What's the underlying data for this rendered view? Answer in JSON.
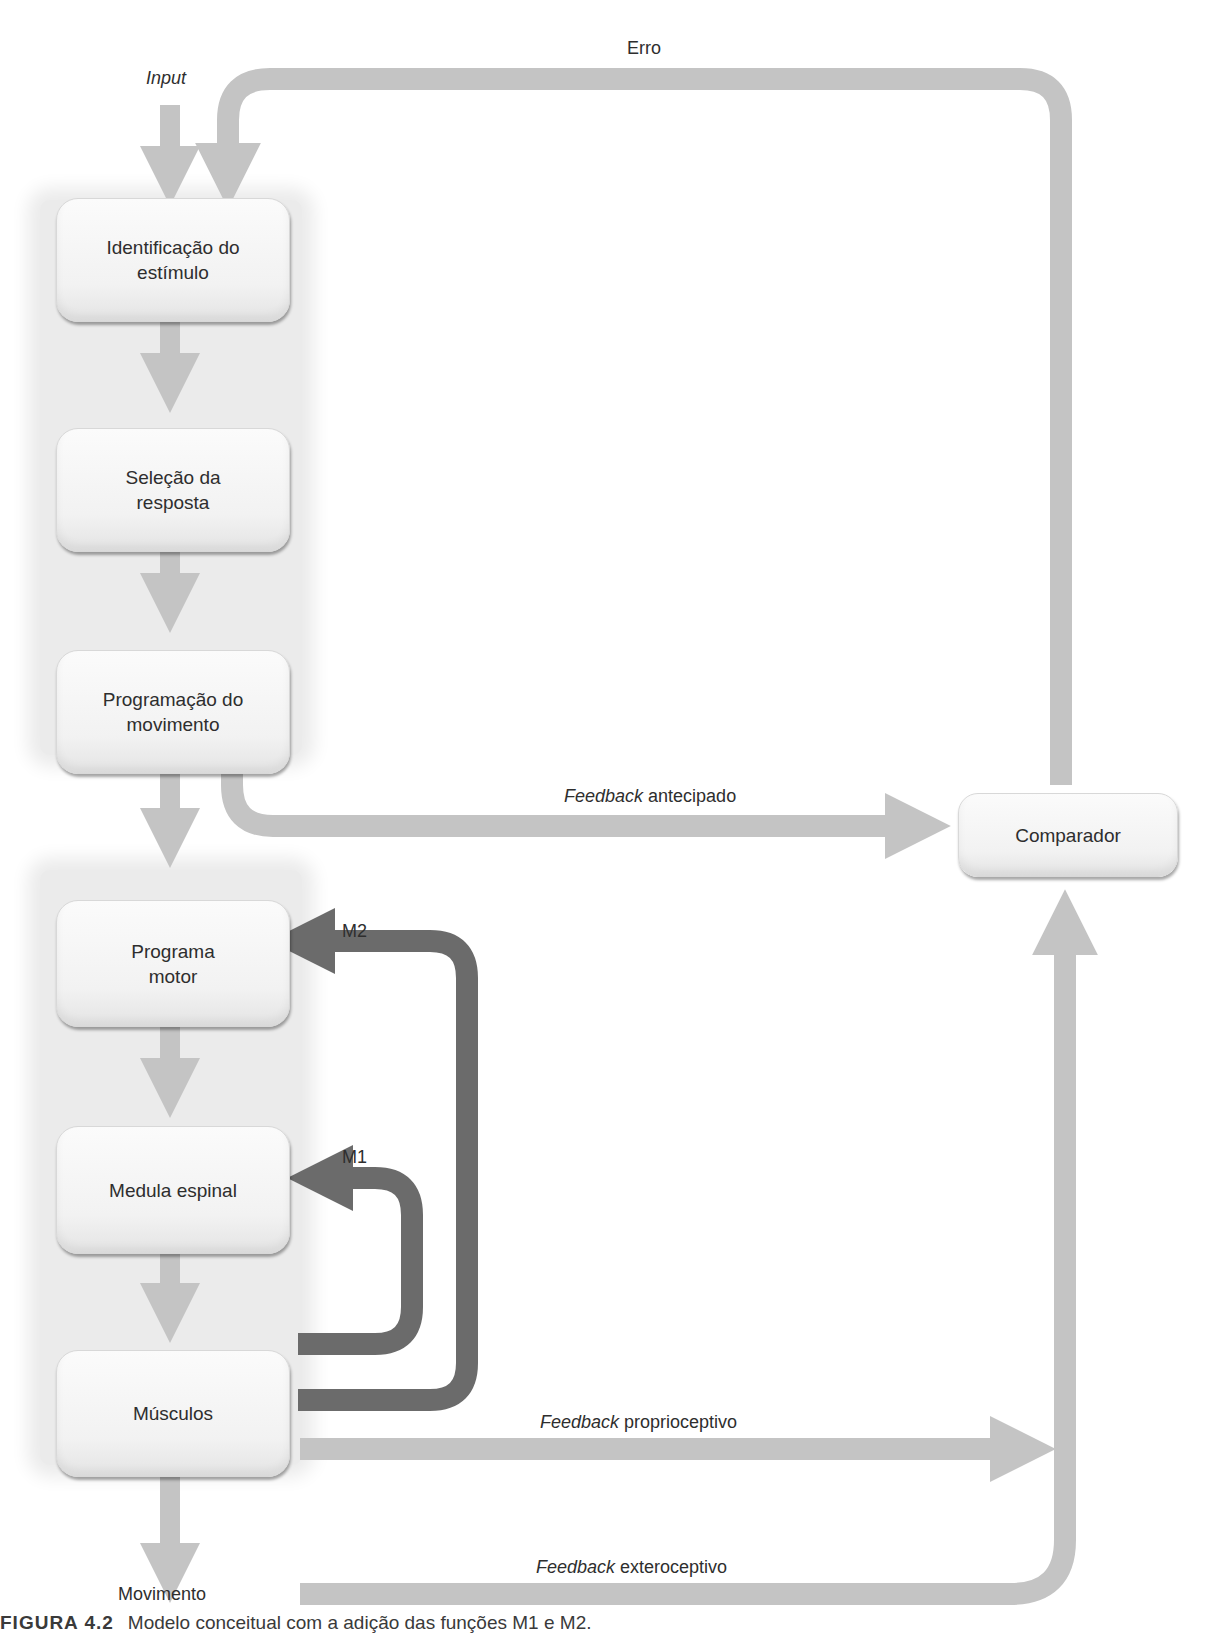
{
  "diagram": {
    "top_labels": {
      "input": "Input",
      "erro": "Erro"
    },
    "upper_group": [
      {
        "id": "identificacao",
        "line1": "Identificação do",
        "line2": "estímulo"
      },
      {
        "id": "selecao",
        "line1": "Seleção da",
        "line2": "resposta"
      },
      {
        "id": "programacao",
        "line1": "Programação do",
        "line2": "movimento"
      }
    ],
    "lower_group": [
      {
        "id": "programa-motor",
        "line1": "Programa",
        "line2": "motor"
      },
      {
        "id": "medula",
        "line1": "Medula espinal",
        "line2": ""
      },
      {
        "id": "musculos",
        "line1": "Músculos",
        "line2": ""
      }
    ],
    "comparator": {
      "label": "Comparador"
    },
    "loops": {
      "m1": "M1",
      "m2": "M2"
    },
    "feedback": {
      "antecipado": {
        "italic": "Feedback",
        "rest": " antecipado"
      },
      "proprioceptivo": {
        "italic": "Feedback",
        "rest": " proprioceptivo"
      },
      "exteroceptivo": {
        "italic": "Feedback",
        "rest": " exteroceptivo"
      }
    },
    "output_label": "Movimento",
    "caption": {
      "prefix": "FIGURA 4.2",
      "text": "Modelo conceitual com a adição das funções M1 e M2."
    },
    "colors": {
      "light_arrow": "#c4c4c4",
      "dark_arrow": "#6b6b6b",
      "panel": "#ebebeb",
      "box": "#f6f6f6"
    }
  }
}
